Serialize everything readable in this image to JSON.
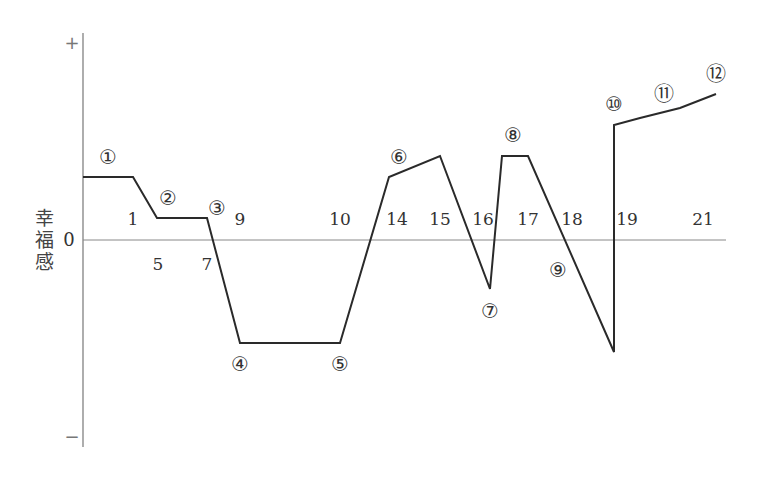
{
  "chart_data": {
    "type": "line",
    "title": "",
    "xlabel": "",
    "ylabel": "幸福感",
    "y_axis_markers": {
      "top": "+",
      "zero": "0",
      "bottom": "−"
    },
    "grid": false,
    "legend": null,
    "x_tick_labels_above_zero": [
      "1",
      "9",
      "10",
      "14",
      "15",
      "16",
      "17",
      "18",
      "19",
      "21"
    ],
    "x_tick_labels_below_zero": [
      "5",
      "7"
    ],
    "polyline_px": [
      [
        83,
        177
      ],
      [
        133,
        177
      ],
      [
        157,
        218
      ],
      [
        207,
        218
      ],
      [
        240,
        343
      ],
      [
        340,
        343
      ],
      [
        389,
        177
      ],
      [
        440,
        156
      ],
      [
        490,
        289
      ],
      [
        502,
        156
      ],
      [
        528,
        156
      ],
      [
        614,
        352
      ],
      [
        614,
        125
      ],
      [
        640,
        118
      ],
      [
        680,
        108
      ],
      [
        716,
        94
      ]
    ],
    "relative_values": [
      {
        "point": "①",
        "age_label": "1",
        "value": 0.6
      },
      {
        "point": "②",
        "age_label": "5",
        "value": 0.2
      },
      {
        "point": "③",
        "age_label": "7",
        "value": 0.2
      },
      {
        "point": "④",
        "age_label": "9",
        "value": -1.0
      },
      {
        "point": "⑤",
        "age_label": "10",
        "value": -1.0
      },
      {
        "point": "⑥",
        "age_label": "14",
        "value": 0.6
      },
      {
        "point": "⑥",
        "age_label": "15",
        "value": 0.8
      },
      {
        "point": "⑦",
        "age_label": "16",
        "value": -0.47
      },
      {
        "point": "⑧",
        "age_label": "17",
        "value": 0.8
      },
      {
        "point": "⑨",
        "age_label": "18",
        "value": -1.08
      },
      {
        "point": "⑩",
        "age_label": "19",
        "value": 1.1
      },
      {
        "point": "⑪",
        "age_label": "",
        "value": 1.2
      },
      {
        "point": "⑫",
        "age_label": "21",
        "value": 1.41
      }
    ],
    "ylim": [
      -2,
      2
    ]
  },
  "axis": {
    "ylabel": [
      "幸",
      "福",
      "感"
    ],
    "plus": "+",
    "zero": "0",
    "minus": "−"
  },
  "ticks": [
    {
      "text": "1",
      "x": 133,
      "y": 219
    },
    {
      "text": "5",
      "x": 158,
      "y": 264
    },
    {
      "text": "7",
      "x": 207,
      "y": 264
    },
    {
      "text": "9",
      "x": 240,
      "y": 219
    },
    {
      "text": "10",
      "x": 340,
      "y": 219
    },
    {
      "text": "14",
      "x": 397,
      "y": 219
    },
    {
      "text": "15",
      "x": 440,
      "y": 219
    },
    {
      "text": "16",
      "x": 483,
      "y": 219
    },
    {
      "text": "17",
      "x": 528,
      "y": 219
    },
    {
      "text": "18",
      "x": 572,
      "y": 219
    },
    {
      "text": "19",
      "x": 627,
      "y": 219
    },
    {
      "text": "21",
      "x": 703,
      "y": 219
    }
  ],
  "points": [
    {
      "text": "①",
      "x": 108,
      "y": 157
    },
    {
      "text": "②",
      "x": 168,
      "y": 198
    },
    {
      "text": "③",
      "x": 217,
      "y": 208
    },
    {
      "text": "④",
      "x": 240,
      "y": 364
    },
    {
      "text": "⑤",
      "x": 340,
      "y": 364
    },
    {
      "text": "⑥",
      "x": 399,
      "y": 157
    },
    {
      "text": "⑦",
      "x": 490,
      "y": 311
    },
    {
      "text": "⑧",
      "x": 513,
      "y": 135
    },
    {
      "text": "⑨",
      "x": 558,
      "y": 270
    },
    {
      "text": "⑩",
      "x": 614,
      "y": 104
    },
    {
      "text": "⑪",
      "x": 664,
      "y": 94
    },
    {
      "text": "⑫",
      "x": 716,
      "y": 74
    }
  ]
}
